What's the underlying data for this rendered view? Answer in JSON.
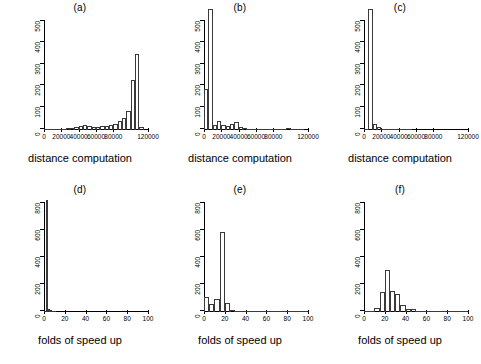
{
  "figure": {
    "background": "#ffffff",
    "line_color": "#000000",
    "layout": "2 rows x 3 columns of histograms"
  },
  "chart_data": [
    {
      "type": "bar",
      "panel": "a",
      "title": "(a)",
      "xlabel": "distance computation",
      "ylabel": "",
      "xlim": [
        0,
        120000
      ],
      "ylim": [
        0,
        500
      ],
      "xticks": [
        0,
        20000,
        40000,
        60000,
        80000,
        120000
      ],
      "xticklabels": [
        "0",
        "20000",
        "40000",
        "60000",
        "80000",
        "120000"
      ],
      "yticks": [
        0,
        100,
        200,
        300,
        400,
        500
      ],
      "yticklabels": [
        "0",
        "100",
        "200",
        "300",
        "400",
        "500"
      ],
      "grid": false,
      "legend": "none",
      "bin_width": 5000,
      "bin_starts": [
        0,
        5000,
        10000,
        15000,
        20000,
        25000,
        30000,
        35000,
        40000,
        45000,
        50000,
        55000,
        60000,
        65000,
        70000,
        75000,
        80000,
        85000,
        90000,
        95000,
        100000,
        105000,
        110000
      ],
      "values": [
        3,
        3,
        4,
        5,
        6,
        8,
        10,
        12,
        20,
        22,
        18,
        15,
        16,
        18,
        20,
        24,
        30,
        40,
        55,
        90,
        230,
        350,
        12
      ]
    },
    {
      "type": "bar",
      "panel": "b",
      "title": "(b)",
      "xlabel": "distance computation",
      "ylabel": "",
      "xlim": [
        0,
        120000
      ],
      "ylim": [
        0,
        500
      ],
      "xticks": [
        0,
        20000,
        40000,
        60000,
        80000,
        120000
      ],
      "xticklabels": [
        "0",
        "20000",
        "40000",
        "60000",
        "80000",
        "120000"
      ],
      "yticks": [
        0,
        100,
        200,
        300,
        400,
        500
      ],
      "yticklabels": [
        "0",
        "100",
        "200",
        "300",
        "400",
        "500"
      ],
      "grid": false,
      "legend": "none",
      "bin_width": 5000,
      "bin_starts": [
        0,
        5000,
        10000,
        15000,
        20000,
        25000,
        30000,
        35000,
        40000,
        45000,
        50000,
        55000,
        60000,
        65000,
        70000,
        75000,
        80000,
        85000,
        90000,
        95000,
        100000,
        105000,
        110000
      ],
      "values": [
        190,
        560,
        25,
        40,
        22,
        18,
        30,
        38,
        14,
        8,
        7,
        6,
        5,
        4,
        4,
        3,
        3,
        3,
        2,
        8,
        2,
        2,
        1
      ],
      "note": "second bar is clipped above the plotting region (exceeds 500)"
    },
    {
      "type": "bar",
      "panel": "c",
      "title": "(c)",
      "xlabel": "distance computation",
      "ylabel": "",
      "xlim": [
        0,
        120000
      ],
      "ylim": [
        0,
        500
      ],
      "xticks": [
        0,
        20000,
        40000,
        60000,
        80000,
        120000
      ],
      "xticklabels": [
        "0",
        "20000",
        "40000",
        "60000",
        "80000",
        "120000"
      ],
      "yticks": [
        0,
        100,
        200,
        300,
        400,
        500
      ],
      "yticklabels": [
        "0",
        "100",
        "200",
        "300",
        "400",
        "500"
      ],
      "grid": false,
      "legend": "none",
      "bin_width": 5000,
      "bin_starts": [
        0,
        5000,
        10000,
        15000,
        20000,
        25000,
        30000,
        35000,
        40000,
        45000,
        50000
      ],
      "values": [
        2,
        560,
        30,
        12,
        6,
        3,
        2,
        1,
        1,
        1,
        1
      ],
      "note": "second bar is clipped above the plotting region (exceeds 500)"
    },
    {
      "type": "bar",
      "panel": "d",
      "title": "(d)",
      "xlabel": "folds of speed up",
      "ylabel": "",
      "xlim": [
        0,
        100
      ],
      "ylim": [
        0,
        800
      ],
      "xticks": [
        0,
        20,
        40,
        60,
        80,
        100
      ],
      "xticklabels": [
        "0",
        "20",
        "40",
        "60",
        "80",
        "100"
      ],
      "yticks": [
        0,
        200,
        400,
        600,
        800
      ],
      "yticklabels": [
        "0",
        "200",
        "400",
        "600",
        "800"
      ],
      "grid": false,
      "legend": "none",
      "bin_width": 2,
      "bin_starts": [
        0,
        2,
        4,
        6,
        8,
        10
      ],
      "values": [
        10,
        830,
        25,
        12,
        5,
        2
      ]
    },
    {
      "type": "bar",
      "panel": "e",
      "title": "(e)",
      "xlabel": "folds of speed up",
      "ylabel": "",
      "xlim": [
        0,
        100
      ],
      "ylim": [
        0,
        800
      ],
      "xticks": [
        0,
        20,
        40,
        60,
        80,
        100
      ],
      "xticklabels": [
        "0",
        "20",
        "40",
        "60",
        "80",
        "100"
      ],
      "yticks": [
        0,
        200,
        400,
        600,
        800
      ],
      "yticklabels": [
        "0",
        "200",
        "400",
        "600",
        "800"
      ],
      "grid": false,
      "legend": "none",
      "bin_width": 5,
      "bin_starts": [
        0,
        5,
        10,
        15,
        20,
        25,
        30,
        35,
        40,
        45,
        50,
        55,
        60,
        65,
        70,
        75,
        80,
        85,
        90,
        95
      ],
      "values": [
        110,
        60,
        95,
        590,
        70,
        18,
        8,
        5,
        4,
        3,
        3,
        2,
        2,
        2,
        2,
        2,
        1,
        1,
        1,
        1
      ]
    },
    {
      "type": "bar",
      "panel": "f",
      "title": "(f)",
      "xlabel": "folds of speed up",
      "ylabel": "",
      "xlim": [
        0,
        100
      ],
      "ylim": [
        0,
        800
      ],
      "xticks": [
        0,
        20,
        40,
        60,
        80,
        100
      ],
      "xticklabels": [
        "0",
        "20",
        "40",
        "60",
        "80",
        "100"
      ],
      "yticks": [
        0,
        200,
        400,
        600,
        800
      ],
      "yticklabels": [
        "0",
        "200",
        "400",
        "600",
        "800"
      ],
      "grid": false,
      "legend": "none",
      "bin_width": 5,
      "bin_starts": [
        0,
        5,
        10,
        15,
        20,
        25,
        30,
        35,
        40,
        45,
        50,
        55,
        60,
        65,
        70,
        75,
        80,
        85,
        90,
        95
      ],
      "values": [
        2,
        8,
        30,
        150,
        310,
        155,
        130,
        55,
        22,
        20,
        8,
        6,
        5,
        4,
        3,
        3,
        2,
        2,
        2,
        2
      ]
    }
  ]
}
